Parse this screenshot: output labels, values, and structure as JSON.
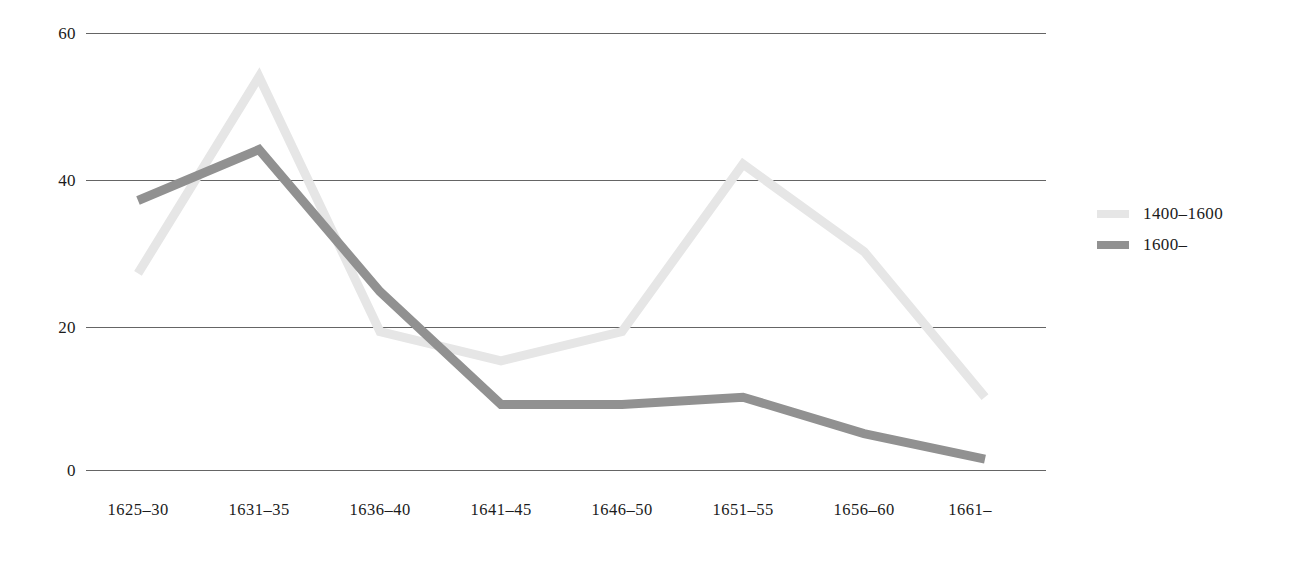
{
  "chart_data": {
    "type": "line",
    "title": "",
    "xlabel": "",
    "ylabel": "",
    "categories": [
      "1625–30",
      "1631–35",
      "1636–40",
      "1641–45",
      "1646–50",
      "1651–55",
      "1656–60",
      "1661–"
    ],
    "series": [
      {
        "name": "1400–1600",
        "color": "#e6e6e6",
        "values": [
          27,
          54,
          19,
          15,
          19,
          42,
          30,
          10
        ]
      },
      {
        "name": "1600–",
        "color": "#919191",
        "values": [
          37,
          44,
          24.5,
          9,
          9,
          10,
          5,
          1.5
        ]
      }
    ],
    "ylim": [
      0,
      60
    ],
    "yticks": [
      60,
      40,
      20,
      0
    ],
    "ytick_labels": [
      "60",
      "40",
      "20",
      "0"
    ],
    "grid": true,
    "grid_color": "#4a4a4a",
    "legend_position": "right"
  },
  "legend": {
    "entries": [
      {
        "label": "1400–1600",
        "color": "#e6e6e6"
      },
      {
        "label": "1600–",
        "color": "#919191"
      }
    ]
  },
  "axes": {
    "y": {
      "ticks": [
        {
          "label": "60",
          "value": 60
        },
        {
          "label": "40",
          "value": 40
        },
        {
          "label": "20",
          "value": 20
        },
        {
          "label": "0",
          "value": 0
        }
      ]
    },
    "x": {
      "ticks": [
        {
          "label": "1625–30"
        },
        {
          "label": "1631–35"
        },
        {
          "label": "1636–40"
        },
        {
          "label": "1641–45"
        },
        {
          "label": "1646–50"
        },
        {
          "label": "1651–55"
        },
        {
          "label": "1656–60"
        },
        {
          "label": "1661–"
        }
      ]
    }
  }
}
